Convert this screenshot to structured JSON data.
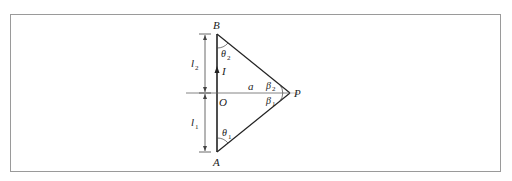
{
  "diagram": {
    "points": {
      "A": {
        "label": "A",
        "x": 217,
        "y": 152
      },
      "B": {
        "label": "B",
        "x": 217,
        "y": 34
      },
      "O": {
        "label": "O",
        "x": 217,
        "y": 93
      },
      "P": {
        "label": "P",
        "x": 290,
        "y": 93
      }
    },
    "labels": {
      "A": "A",
      "B": "B",
      "O": "O",
      "P": "P",
      "current": "I",
      "distance": "a",
      "l1": "l",
      "l1_sub": "1",
      "l2": "l",
      "l2_sub": "2",
      "theta1": "θ",
      "theta1_sub": "1",
      "theta2": "θ",
      "theta2_sub": "2",
      "beta1": "β",
      "beta1_sub": "1",
      "beta2": "β",
      "beta2_sub": "2"
    },
    "colors": {
      "line": "#222222",
      "thin_line": "#555555",
      "frame": "#9a9a9a"
    }
  }
}
